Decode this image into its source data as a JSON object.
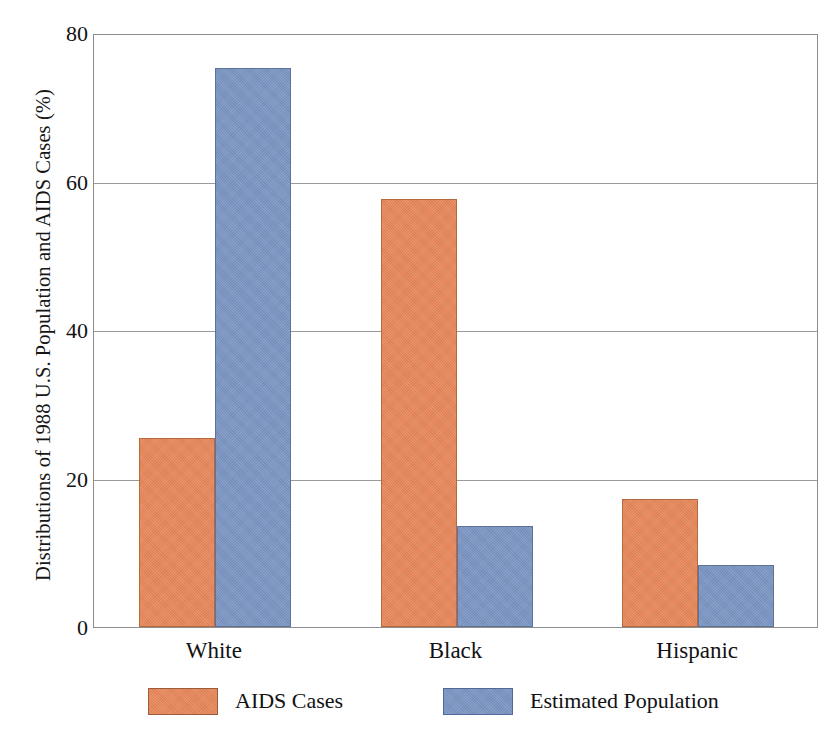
{
  "chart_data": {
    "type": "bar",
    "title": "",
    "xlabel": "",
    "ylabel": "Distributions of 1988 U.S. Population and AIDS Cases (%)",
    "categories": [
      "White",
      "Black",
      "Hispanic"
    ],
    "series": [
      {
        "name": "AIDS Cases",
        "color": "#e8875a",
        "values": [
          25.4,
          57.7,
          17.2
        ]
      },
      {
        "name": "Estimated Population",
        "color": "#7b95c3",
        "values": [
          75.3,
          13.6,
          8.3
        ]
      }
    ],
    "ylim": [
      0,
      80
    ],
    "yticks": [
      0,
      20,
      40,
      60,
      80
    ],
    "ytick_labels": [
      "0",
      "20",
      "40",
      "60",
      "80"
    ],
    "grid": true,
    "legend_position": "bottom"
  },
  "legend": {
    "entries": [
      {
        "label": "AIDS Cases"
      },
      {
        "label": "Estimated Population"
      }
    ]
  }
}
